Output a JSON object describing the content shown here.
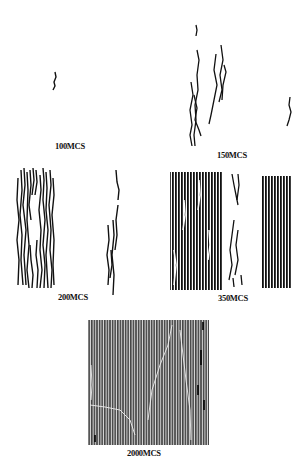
{
  "figure": {
    "panels": [
      {
        "id": "p100",
        "label": "100MCS"
      },
      {
        "id": "p150",
        "label": "150MCS"
      },
      {
        "id": "p200",
        "label": "200MCS"
      },
      {
        "id": "p350",
        "label": "350MCS"
      },
      {
        "id": "p2000",
        "label": "2000MCS"
      }
    ],
    "colors": {
      "ink": "#111111",
      "background": "#ffffff",
      "dense_fill": "#555555"
    }
  }
}
